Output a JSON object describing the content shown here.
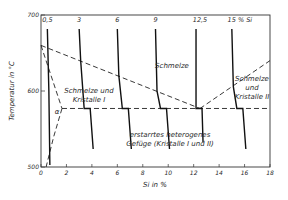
{
  "chart_data": {
    "type": "phase-diagram",
    "title": "",
    "xlabel": "Si in %",
    "ylabel": "Temperatur in °C",
    "xlim": [
      0,
      18
    ],
    "ylim": [
      500,
      700
    ],
    "x_ticks": [
      0,
      2,
      4,
      6,
      8,
      10,
      12,
      14,
      16,
      18
    ],
    "x_tick_labels": [
      "0",
      "2",
      "4",
      "6",
      "8",
      "10",
      "12",
      "14",
      "16",
      "18"
    ],
    "y_ticks": [
      500,
      600,
      700
    ],
    "y_tick_labels": [
      "500",
      "600",
      "700"
    ],
    "liquidus_left": [
      [
        0,
        660
      ],
      [
        12.5,
        577
      ]
    ],
    "liquidus_right": [
      [
        12.5,
        577
      ],
      [
        18,
        640
      ]
    ],
    "eutectic_temperature": 577,
    "eutectic_composition": 12.5,
    "solidus_alpha": [
      [
        0,
        660
      ],
      [
        1.65,
        577
      ]
    ],
    "solvus_alpha": [
      [
        1.65,
        577
      ],
      [
        1.0,
        540
      ],
      [
        0.4,
        500
      ]
    ],
    "cooling_curves": [
      {
        "label": "0,5",
        "composition": 0.5
      },
      {
        "label": "3",
        "composition": 3
      },
      {
        "label": "6",
        "composition": 6
      },
      {
        "label": "9",
        "composition": 9
      },
      {
        "label": "12,5",
        "composition": 12.5
      },
      {
        "label": "15 % Si",
        "composition": 15
      }
    ],
    "regions": [
      {
        "name": "melt",
        "text": "Schmelze"
      },
      {
        "name": "melt-crystals-I",
        "lines": [
          "Schmelze und",
          "Kristalle I"
        ]
      },
      {
        "name": "melt-crystals-II",
        "lines": [
          "Schmelze",
          "und",
          "Kristalle II"
        ]
      },
      {
        "name": "solid",
        "lines": [
          "erstarrtes heterogenes",
          "Gefüge (Kristalle I und II)"
        ]
      },
      {
        "name": "alpha",
        "text": "α"
      }
    ]
  }
}
